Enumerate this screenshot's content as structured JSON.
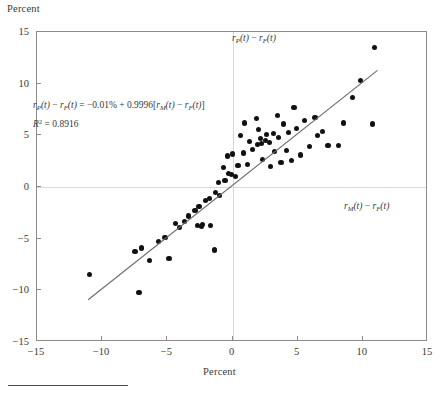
{
  "figure": {
    "y_axis_caption": "Percent",
    "x_axis_caption": "Percent",
    "vertical_axis_annotation": "r_P(t) − r_F(t)",
    "horizontal_axis_annotation": "r_M(t) − r_F(t)",
    "equation_line1": "r_P(t) − r_F(t) = −0.01% + 0.9996[r_M(t) − r_F(t)]",
    "equation_line2": "R² = 0.8916",
    "intercept": "−0.01%",
    "slope": "0.9996",
    "r_squared": "0.8916"
  },
  "chart_data": {
    "type": "scatter",
    "title": "",
    "xlabel": "Percent",
    "ylabel": "Percent",
    "xlim": [
      -15,
      15
    ],
    "ylim": [
      -15,
      15
    ],
    "xticks": [
      -15,
      -10,
      -5,
      0,
      5,
      10,
      15
    ],
    "yticks": [
      -15,
      -10,
      -5,
      0,
      5,
      10,
      15
    ],
    "xtick_labels": [
      "−15",
      "−10",
      "−5",
      "0",
      "5",
      "10",
      "15"
    ],
    "ytick_labels": [
      "−15",
      "−10",
      "−5",
      "0",
      "5",
      "10",
      "15"
    ],
    "grid": "zero-reference-lines-only",
    "legend": "none",
    "series_name": "Excess portfolio return vs. excess market return",
    "points": [
      [
        -10.9,
        -8.6
      ],
      [
        -7.4,
        -6.3
      ],
      [
        -7.1,
        -10.3
      ],
      [
        -6.9,
        -6.0
      ],
      [
        -6.3,
        -7.2
      ],
      [
        -5.6,
        -5.4
      ],
      [
        -5.1,
        -5.0
      ],
      [
        -4.8,
        -7.0
      ],
      [
        -4.3,
        -3.6
      ],
      [
        -4.0,
        -4.0
      ],
      [
        -3.6,
        -3.4
      ],
      [
        -3.3,
        -2.9
      ],
      [
        -2.8,
        -2.4
      ],
      [
        -2.6,
        -3.8
      ],
      [
        -2.5,
        -2.0
      ],
      [
        -2.3,
        -3.9
      ],
      [
        -2.2,
        -3.7
      ],
      [
        -2.0,
        -1.4
      ],
      [
        -1.7,
        -1.2
      ],
      [
        -1.6,
        -3.8
      ],
      [
        -1.3,
        -6.2
      ],
      [
        -1.2,
        -0.6
      ],
      [
        -1.0,
        0.3
      ],
      [
        -0.9,
        -0.9
      ],
      [
        -0.6,
        1.8
      ],
      [
        -0.5,
        0.5
      ],
      [
        -0.3,
        2.9
      ],
      [
        -0.2,
        1.2
      ],
      [
        0.0,
        1.1
      ],
      [
        0.1,
        3.1
      ],
      [
        0.3,
        0.9
      ],
      [
        0.5,
        2.0
      ],
      [
        0.7,
        4.9
      ],
      [
        0.9,
        3.2
      ],
      [
        1.0,
        6.1
      ],
      [
        1.2,
        2.1
      ],
      [
        1.4,
        4.3
      ],
      [
        1.6,
        3.5
      ],
      [
        1.9,
        6.5
      ],
      [
        2.0,
        4.0
      ],
      [
        2.1,
        5.5
      ],
      [
        2.2,
        4.6
      ],
      [
        2.3,
        4.1
      ],
      [
        2.4,
        2.6
      ],
      [
        2.6,
        4.4
      ],
      [
        2.7,
        5.0
      ],
      [
        2.9,
        4.2
      ],
      [
        3.0,
        1.9
      ],
      [
        3.2,
        5.1
      ],
      [
        3.3,
        3.3
      ],
      [
        3.5,
        6.8
      ],
      [
        3.6,
        4.7
      ],
      [
        3.8,
        2.3
      ],
      [
        4.0,
        6.0
      ],
      [
        4.2,
        3.4
      ],
      [
        4.4,
        5.2
      ],
      [
        4.6,
        2.5
      ],
      [
        4.8,
        7.6
      ],
      [
        5.0,
        5.6
      ],
      [
        5.3,
        3.0
      ],
      [
        5.6,
        6.3
      ],
      [
        6.0,
        3.8
      ],
      [
        6.4,
        6.6
      ],
      [
        6.6,
        4.9
      ],
      [
        7.0,
        5.3
      ],
      [
        7.4,
        3.9
      ],
      [
        8.2,
        3.9
      ],
      [
        8.6,
        6.1
      ],
      [
        9.3,
        8.6
      ],
      [
        9.9,
        10.2
      ],
      [
        10.8,
        6.0
      ],
      [
        11.0,
        13.4
      ]
    ],
    "fit_line": {
      "equation": "y = −0.01 + 0.9996x",
      "intercept": -0.01,
      "slope": 0.9996,
      "r_squared": 0.8916,
      "x_start": -11.0,
      "x_end": 11.2
    }
  }
}
